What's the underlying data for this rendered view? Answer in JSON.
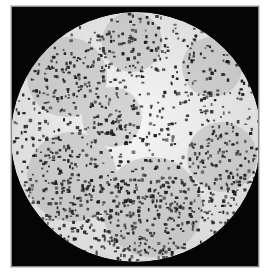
{
  "image": {
    "type": "microscope-field",
    "description": "Circular bright-field micrograph showing densely scattered dark particles on a light background, surrounded by a black square mask",
    "colors": {
      "background": "#ffffff",
      "mask": "#050505",
      "border": "#8a8a8a",
      "field_light": "#f4f4f4",
      "field_mid": "#cfcfcf",
      "particle": "#1e1e1e"
    },
    "frame": {
      "x": 11,
      "y": 6,
      "width": 248,
      "height": 261
    },
    "circle": {
      "cx": 135,
      "cy": 136,
      "r": 125
    }
  }
}
